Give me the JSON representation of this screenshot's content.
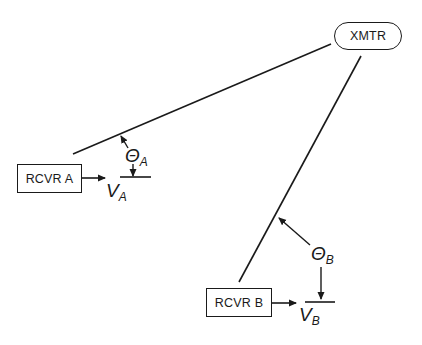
{
  "diagram": {
    "type": "direction-finding geometry",
    "nodes": {
      "transmitter": {
        "label": "XMTR",
        "shape": "rounded-rect"
      },
      "receiver_a": {
        "label": "RCVR A",
        "shape": "rect"
      },
      "receiver_b": {
        "label": "RCVR B",
        "shape": "rect"
      }
    },
    "labels": {
      "theta_a": {
        "symbol": "Θ",
        "subscript": "A"
      },
      "v_a": {
        "symbol": "V",
        "subscript": "A"
      },
      "theta_b": {
        "symbol": "Θ",
        "subscript": "B"
      },
      "v_b": {
        "symbol": "V",
        "subscript": "B"
      }
    },
    "edges": [
      {
        "from": "transmitter",
        "to": "receiver_a",
        "kind": "line-of-bearing"
      },
      {
        "from": "transmitter",
        "to": "receiver_b",
        "kind": "line-of-bearing"
      },
      {
        "from": "receiver_a",
        "to": "v_a",
        "kind": "arrow"
      },
      {
        "from": "receiver_b",
        "to": "v_b",
        "kind": "arrow"
      }
    ],
    "colors": {
      "ink": "#1a1a1a",
      "background": "#ffffff"
    }
  }
}
